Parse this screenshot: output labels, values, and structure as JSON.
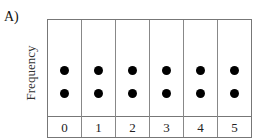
{
  "figure_label": "A)",
  "chart_data": {
    "type": "scatter",
    "subtype": "dot_plot",
    "title": "",
    "xlabel": "",
    "ylabel": "Frequency",
    "categories": [
      "0",
      "1",
      "2",
      "3",
      "4",
      "5"
    ],
    "values": [
      2,
      2,
      2,
      2,
      2,
      2
    ],
    "grid": "column dividers",
    "legend": "none"
  }
}
